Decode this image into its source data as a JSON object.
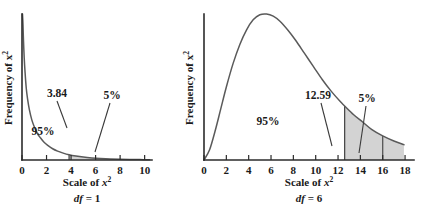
{
  "figure": {
    "background": "#ffffff",
    "curve_color": "#5a5a5a",
    "shade_color": "#d3d3d3",
    "axis_color": "#2b2b2b"
  },
  "chart_data": [
    {
      "type": "line",
      "title": "",
      "subtitle": "df = 1",
      "xlabel": "Scale of x²",
      "ylabel": "Frequency of x²",
      "df": 1,
      "xlim": [
        0,
        10.6
      ],
      "ylim": [
        0,
        1
      ],
      "grid": false,
      "legend": "none",
      "xticks": [
        0,
        2,
        4,
        6,
        8,
        10
      ],
      "xtick_labels": [
        "0",
        "2",
        "4",
        "6",
        "8",
        "10"
      ],
      "yticks": [],
      "ytick_labels": [],
      "critical_value": 3.84,
      "critical_value_label": "3.84",
      "shaded_from": 3.84,
      "shaded_to": 10.4,
      "shaded_divider": 8,
      "annotations": [
        {
          "text": "3.84",
          "x": 3.84,
          "kind": "critical-value"
        },
        {
          "text": "95%",
          "x": 2.0,
          "kind": "region-left"
        },
        {
          "text": "5%",
          "x": 6.3,
          "kind": "region-tail"
        }
      ],
      "series": [
        {
          "name": "chi-square df=1",
          "x": [
            0.04,
            0.08,
            0.12,
            0.18,
            0.25,
            0.35,
            0.45,
            0.6,
            0.8,
            1.0,
            1.25,
            1.5,
            1.8,
            2.1,
            2.5,
            2.9,
            3.3,
            3.84,
            4.4,
            5.0,
            5.7,
            6.4,
            7.2,
            8.0,
            8.8,
            9.6,
            10.4
          ],
          "y": [
            1.0,
            0.93,
            0.82,
            0.7,
            0.6,
            0.49,
            0.42,
            0.345,
            0.275,
            0.228,
            0.183,
            0.152,
            0.121,
            0.1,
            0.077,
            0.061,
            0.049,
            0.036,
            0.027,
            0.02,
            0.0145,
            0.0105,
            0.0073,
            0.0052,
            0.0037,
            0.0026,
            0.0019
          ]
        }
      ]
    },
    {
      "type": "line",
      "title": "",
      "subtitle": "df = 6",
      "xlabel": "Scale of x²",
      "ylabel": "Frequency of x²",
      "df": 6,
      "xlim": [
        0,
        18.8
      ],
      "ylim": [
        0,
        1
      ],
      "grid": false,
      "legend": "none",
      "xticks": [
        0,
        2,
        4,
        6,
        8,
        10,
        12,
        14,
        16,
        18
      ],
      "xtick_labels": [
        "0",
        "2",
        "4",
        "6",
        "8",
        "10",
        "12",
        "14",
        "16",
        "18"
      ],
      "yticks": [],
      "ytick_labels": [],
      "critical_value": 12.59,
      "critical_value_label": "12.59",
      "shaded_from": 12.59,
      "shaded_to": 17.9,
      "shaded_divider": 16,
      "annotations": [
        {
          "text": "12.59",
          "x": 12.59,
          "kind": "critical-value"
        },
        {
          "text": "95%",
          "x": 5.6,
          "kind": "region-left"
        },
        {
          "text": "5%",
          "x": 15.1,
          "kind": "region-tail"
        }
      ],
      "series": [
        {
          "name": "chi-square df=6",
          "x": [
            0.0,
            0.5,
            1.0,
            1.5,
            2.0,
            2.6,
            3.2,
            3.8,
            4.4,
            5.0,
            5.6,
            6.2,
            6.8,
            7.5,
            8.2,
            9.0,
            9.8,
            10.6,
            11.4,
            12.2,
            12.59,
            13.4,
            14.2,
            15.0,
            16.0,
            17.0,
            17.9
          ],
          "y": [
            0.0,
            0.07,
            0.2,
            0.35,
            0.5,
            0.66,
            0.79,
            0.89,
            0.96,
            0.995,
            1.0,
            0.985,
            0.95,
            0.89,
            0.82,
            0.73,
            0.64,
            0.55,
            0.47,
            0.4,
            0.37,
            0.31,
            0.26,
            0.21,
            0.165,
            0.13,
            0.105
          ]
        }
      ]
    }
  ],
  "panels": {
    "left": {
      "xlabel_prefix": "Scale of ",
      "xlabel_var": "x",
      "xlabel_exp": "2",
      "df_prefix": "df",
      "df_value": " = 1",
      "ylabel_prefix": "Frequency of ",
      "ylabel_var": "x",
      "ylabel_exp": "2",
      "tick_labels": [
        "0",
        "2",
        "4",
        "6",
        "8",
        "10"
      ],
      "critical_label": "3.84",
      "pct_left": "95%",
      "pct_tail": "5%"
    },
    "right": {
      "xlabel_prefix": "Scale of ",
      "xlabel_var": "x",
      "xlabel_exp": "2",
      "df_prefix": "df",
      "df_value": " = 6",
      "ylabel_prefix": "Frequency of ",
      "ylabel_var": "x",
      "ylabel_exp": "2",
      "tick_labels": [
        "0",
        "2",
        "4",
        "6",
        "8",
        "10",
        "12",
        "14",
        "16",
        "18"
      ],
      "critical_label": "12.59",
      "pct_left": "95%",
      "pct_tail": "5%"
    }
  }
}
